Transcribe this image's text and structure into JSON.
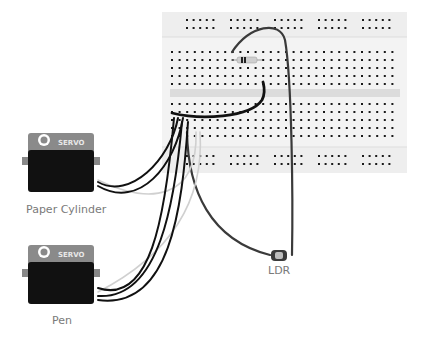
{
  "diagram": {
    "breadboard": {
      "columns": 30,
      "column_labels": [
        "1",
        "5",
        "10",
        "15",
        "20",
        "25",
        "30"
      ],
      "colors": {
        "board": "#f2f2f2",
        "rail": "#ececec",
        "hole": "#1a1a1a",
        "channel": "#dcdcdc"
      }
    },
    "components": [
      {
        "id": "servo-1",
        "type": "servo",
        "brand_text": "SERVO",
        "label": "Paper Cylinder"
      },
      {
        "id": "servo-2",
        "type": "servo",
        "brand_text": "SERVO",
        "label": "Pen"
      },
      {
        "id": "ldr",
        "type": "photoresistor",
        "label": "LDR"
      },
      {
        "id": "resistor",
        "type": "resistor",
        "label": ""
      }
    ],
    "wire_colors": {
      "black": "#111111",
      "dark": "#3a3a3a",
      "white": "#d6d6d6"
    }
  }
}
